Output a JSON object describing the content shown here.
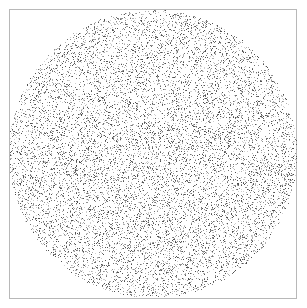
{
  "chart_data": {
    "type": "scatter",
    "title": "",
    "xlabel": "",
    "ylabel": "",
    "shape": "circle",
    "center": [
      153,
      154
    ],
    "radius": 144,
    "point_count": 26000,
    "point_colors": [
      "#d0d0d0",
      "#b0b0b0",
      "#909090",
      "#707070",
      "#505050"
    ],
    "grid": false,
    "legend": null,
    "frame": {
      "x": 9,
      "y": 9,
      "width": 288,
      "height": 290,
      "color": "#b8b8b8"
    }
  }
}
